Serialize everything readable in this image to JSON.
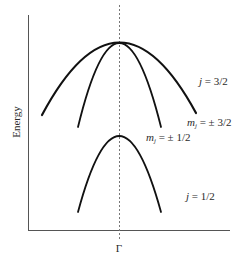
{
  "diagram": {
    "type": "band-structure",
    "y_axis_label": "Energy",
    "x_axis_tick_label": "Γ",
    "bands": [
      {
        "name": "heavy-hole",
        "group": "j = 3/2",
        "label_symbol": "m",
        "label_subscript": "j",
        "label_value": " = ± 3/2",
        "apex": [
          119,
          43
        ],
        "ends": [
          [
            42,
            115
          ],
          [
            196,
            113
          ]
        ],
        "stroke_width": 2.2
      },
      {
        "name": "light-hole",
        "group": "j = 3/2",
        "label_symbol": "m",
        "label_subscript": "j",
        "label_value": " = ± 1/2",
        "apex": [
          119,
          43
        ],
        "ends": [
          [
            78,
            127
          ],
          [
            161,
            127
          ]
        ],
        "stroke_width": 1.8
      },
      {
        "name": "split-off",
        "group": "j = 1/2",
        "apex": [
          119,
          136
        ],
        "ends": [
          [
            78,
            212
          ],
          [
            161,
            212
          ]
        ],
        "stroke_width": 1.8
      }
    ],
    "labels": {
      "j32_symbol": "j",
      "j32_value": " = 3/2",
      "j12_symbol": "j",
      "j12_value": " = 1/2",
      "mj32_symbol": "m",
      "mj32_sub": "j",
      "mj32_value": " = ± 3/2",
      "mj12_symbol": "m",
      "mj12_sub": "j",
      "mj12_value": " = ± 1/2"
    },
    "colors": {
      "curve": "#111111",
      "axis": "#555555",
      "dashed": "#777777",
      "text": "#2a2a2a"
    }
  }
}
